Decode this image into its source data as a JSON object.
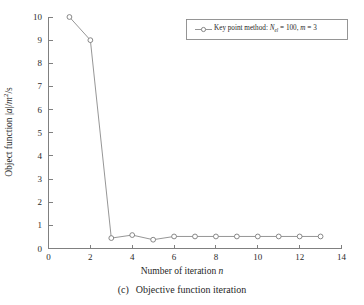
{
  "chart_data": {
    "type": "line",
    "title": "",
    "subtitle": "",
    "xlabel": "Number of iteration n",
    "xlabel_text": "Number of iteration",
    "xlabel_italic": "n",
    "ylabel": "Object function |a|/m2/s",
    "ylabel_prefix": "Object function |",
    "ylabel_italic_a": "a",
    "ylabel_mid": "|/",
    "ylabel_italic_m": "m",
    "ylabel_sup": "2",
    "ylabel_suffix": "/s",
    "xlim": [
      0,
      14
    ],
    "ylim": [
      0,
      10
    ],
    "xticks": [
      0,
      2,
      4,
      6,
      8,
      10,
      12,
      14
    ],
    "xtick_labels": [
      "0",
      "2",
      "4",
      "6",
      "8",
      "10",
      "12",
      "14"
    ],
    "yticks": [
      0,
      1,
      2,
      3,
      4,
      5,
      6,
      7,
      8,
      9,
      10
    ],
    "ytick_labels": [
      "0",
      "1",
      "2",
      "3",
      "4",
      "5",
      "6",
      "7",
      "8",
      "9",
      "10"
    ],
    "grid": false,
    "legend_position": "top-right",
    "marker": "circle-open",
    "line_color": "#8a8a8a",
    "marker_color": "#7a7a7a",
    "axis_color": "#808080",
    "series": [
      {
        "name": "Key point method: Nel = 100, m = 3",
        "x": [
          1,
          2,
          3,
          4,
          5,
          6,
          7,
          8,
          9,
          10,
          11,
          12,
          13
        ],
        "values": [
          10.0,
          9.0,
          0.45,
          0.58,
          0.38,
          0.52,
          0.52,
          0.52,
          0.52,
          0.52,
          0.52,
          0.52,
          0.52
        ]
      }
    ]
  },
  "legend": {
    "entry_prefix": "Key point method: ",
    "entry_symbol_n": "N",
    "entry_symbol_sub": "el",
    "entry_eq1": " = 100, ",
    "entry_symbol_m": "m",
    "entry_eq2": " = 3",
    "entry_full": "Key point method: Nel = 100, m = 3"
  },
  "caption": {
    "tag": "(c)",
    "text": "Objective function iteration"
  }
}
